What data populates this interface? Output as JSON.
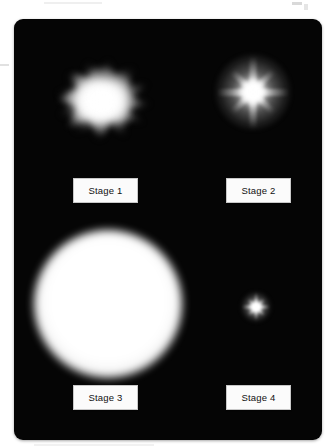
{
  "figure": {
    "background_color": "#050505",
    "panel_corner_radius_px": 9,
    "page_background_color": "#ffffff",
    "label_background_color": "#fbfbfb",
    "label_border_color": "#c8c8c8",
    "label_text_color": "#111111",
    "glow_color": "#ffffff"
  },
  "stages": [
    {
      "id": "stage-1",
      "label": "Stage 1",
      "graphic_name": "irregular-burst-glyph",
      "description": "irregular jagged burst",
      "position": "top-left"
    },
    {
      "id": "stage-2",
      "label": "Stage 2",
      "graphic_name": "eight-point-star-glyph",
      "description": "eight-pointed star with halo",
      "position": "top-right"
    },
    {
      "id": "stage-3",
      "label": "Stage 3",
      "graphic_name": "large-glow-disc-glyph",
      "description": "large soft-edged disc",
      "position": "bottom-left"
    },
    {
      "id": "stage-4",
      "label": "Stage 4",
      "graphic_name": "small-eight-point-star-glyph",
      "description": "small eight-pointed star",
      "position": "bottom-right"
    }
  ]
}
